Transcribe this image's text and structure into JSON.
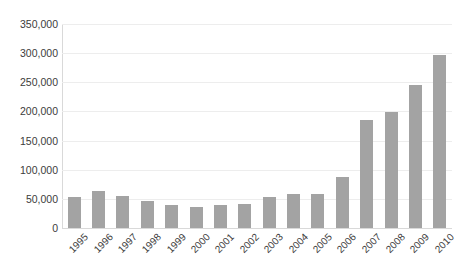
{
  "chart_data": {
    "type": "bar",
    "title": "",
    "subtitle": "",
    "xlabel": "",
    "ylabel": "",
    "categories": [
      "1995",
      "1996",
      "1997",
      "1998",
      "1999",
      "2000",
      "2001",
      "2002",
      "2003",
      "2004",
      "2005",
      "2006",
      "2007",
      "2008",
      "2009",
      "2010"
    ],
    "values": [
      53000,
      63000,
      55000,
      47000,
      39000,
      36000,
      39000,
      41000,
      54000,
      58000,
      59000,
      88000,
      186000,
      199000,
      245000,
      296000
    ],
    "series": [
      {
        "name": "",
        "values": [
          53000,
          63000,
          55000,
          47000,
          39000,
          36000,
          39000,
          41000,
          54000,
          58000,
          59000,
          88000,
          186000,
          199000,
          245000,
          296000
        ]
      }
    ],
    "ylim": [
      0,
      350000
    ],
    "yticks": [
      0,
      50000,
      100000,
      150000,
      200000,
      250000,
      300000,
      350000
    ],
    "ytick_labels": [
      "0",
      "50,000",
      "100,000",
      "150,000",
      "200,000",
      "250,000",
      "300,000",
      "350,000"
    ],
    "grid": true,
    "grid_axis": "y",
    "legend": false,
    "legend_position": "none",
    "bar_color": "#a3a3a3",
    "gridline_color": "#ededed",
    "axis_color": "#d9d9d9",
    "text_color": "#3b3b3b",
    "background": "#ffffff",
    "xtick_rotation": -45,
    "annotations": []
  }
}
